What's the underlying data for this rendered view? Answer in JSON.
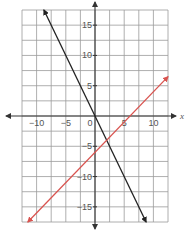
{
  "chart_data": {
    "type": "line",
    "title": "",
    "xlabel": "x",
    "ylabel": "",
    "xlim": [
      -12.5,
      12.5
    ],
    "ylim": [
      -17.5,
      17.5
    ],
    "grid": true,
    "grid_step": 2.5,
    "x_ticks": [
      -10,
      -5,
      0,
      5,
      10
    ],
    "y_ticks": [
      15,
      10,
      5,
      -5,
      -10,
      -15
    ],
    "x_tick_labels": [
      "−10",
      "−5",
      "0",
      "5",
      "10"
    ],
    "y_tick_labels": [
      "15",
      "10",
      "5",
      "−5",
      "−10",
      "−15"
    ],
    "series": [
      {
        "name": "black line",
        "equation": "y = -2x",
        "color": "#222222",
        "x": [
          -8.75,
          8.75
        ],
        "y": [
          17.5,
          -17.5
        ]
      },
      {
        "name": "red line",
        "equation": "y = x - 6",
        "color": "#d9534f",
        "x": [
          -11.5,
          12.5
        ],
        "y": [
          -17.5,
          6.5
        ]
      }
    ],
    "intersection": {
      "x": 2,
      "y": -4
    }
  },
  "labels": {
    "x_axis": "x",
    "x_ticks": [
      "−10",
      "−5",
      "0",
      "5",
      "10"
    ],
    "y_ticks": [
      "15",
      "10",
      "5",
      "−5",
      "−10",
      "−15"
    ]
  }
}
